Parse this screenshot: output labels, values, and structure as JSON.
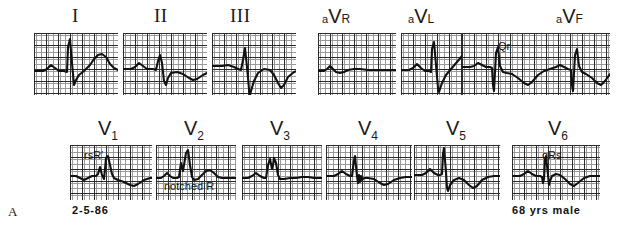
{
  "figure": {
    "letter": "A",
    "date": "2-5-86",
    "patient": "68 yrs male"
  },
  "rows": [
    {
      "name": "limb-leads",
      "panels": [
        {
          "lead": "I",
          "label_kind": "roman",
          "label_text": "I",
          "x": 34,
          "y": 33,
          "w": 84,
          "h": 62,
          "label_x": 72,
          "label_y": 6,
          "annotation": null,
          "trace": "M0,38 L9,38 L13,36 L17,32 L21,35 L25,38 L30,38 L33,39 L34,14 L36,6 L38,30 L40,52 L42,47 L45,42 L50,38 L56,32 L60,26 L64,22 L68,21 L72,24 L76,31 L80,35 L84,37 L92,37 L100,37"
        },
        {
          "lead": "II",
          "label_kind": "roman",
          "label_text": "II",
          "x": 123,
          "y": 33,
          "w": 84,
          "h": 62,
          "label_x": 154,
          "label_y": 6,
          "annotation": null,
          "trace": "M0,36 L8,36 L12,34 L16,30 L20,33 L24,36 L30,36 L33,37 L35,28 L37,22 L39,30 L41,48 L43,52 L45,45 L48,40 L54,39 L60,41 L66,45 L70,47 L74,46 L80,42 L86,39 L92,38 L100,38"
        },
        {
          "lead": "III",
          "label_kind": "roman",
          "label_text": "III",
          "x": 212,
          "y": 33,
          "w": 84,
          "h": 62,
          "label_x": 230,
          "label_y": 6,
          "annotation": null,
          "trace": "M0,33 L10,33 L16,32 L22,34 L26,36 L29,37 L31,27 L33,15 L35,34 L37,56 L38,62 L39,58 L42,48 L46,40 L52,36 L58,37 L62,42 L66,50 L69,55 L72,52 L76,44 L82,39 L88,37 L96,37 L104,37"
        },
        {
          "lead": "aVR",
          "label_kind": "augmented",
          "label_pre": "a",
          "label_main": "V",
          "label_post": "R",
          "x": 318,
          "y": 33,
          "w": 78,
          "h": 62,
          "label_x": 322,
          "label_y": 6,
          "annotation": null,
          "trace": "M0,38 L6,38 L9,36 L12,33 L15,36 L18,39 L22,40 L26,39 L30,37 L36,36 L42,36 L50,37 L58,37 L68,37 L78,37"
        },
        {
          "lead": "aVL",
          "label_kind": "augmented",
          "label_pre": "a",
          "label_main": "V",
          "label_post": "L",
          "x": 401,
          "y": 33,
          "w": 82,
          "h": 62,
          "label_x": 408,
          "label_y": 6,
          "annotation": null,
          "trace": "M0,37 L8,37 L12,35 L16,31 L20,35 L24,38 L28,38 L30,39 L31,16 L33,9 L35,32 L37,55 L38,59 L41,50 L45,42 L50,36 L56,29 L61,23 L66,21 L70,24 L74,31 L78,35 L82,37 L90,37"
        },
        {
          "lead": "aVF",
          "label_kind": "augmented",
          "label_pre": "a",
          "label_main": "V",
          "label_post": "F",
          "x": 462,
          "y": 33,
          "w": 148,
          "h": 62,
          "label_x": 556,
          "label_y": 6,
          "annotation": {
            "text": "Qr",
            "x": 36,
            "y": 8
          },
          "trace": "M0,34 L8,34 L12,33 L16,30 L20,32 L24,34 L28,34 L30,35 L31,52 L32,58 L34,20 L36,14 L38,33 L41,39 L45,40 L50,41 L56,45 L62,50 L66,52 L70,49 L76,42 L82,38 L88,36 L94,34 L98,32 L102,34 L106,36 L109,37 L110,52 L111,58 L113,22 L115,16 L117,33 L120,39 L124,41 L130,45 L135,50 L139,52 L143,48 L148,41 L152,37"
        }
      ]
    },
    {
      "name": "precordial-leads",
      "panels": [
        {
          "lead": "V1",
          "label_kind": "precordial",
          "label_main": "V",
          "label_sub": "1",
          "x": 70,
          "y": 145,
          "w": 82,
          "h": 55,
          "label_x": 98,
          "label_y": 118,
          "annotation": {
            "text": "rsR′",
            "x": 14,
            "y": 5
          },
          "trace": "M0,31 L6,31 L10,33 L14,35 L18,33 L22,31 L26,31 L28,29 L30,22 L32,30 L34,34 L35,24 L36,13 L38,11 L40,20 L42,29 L44,33 L48,35 L54,37 L60,40 L64,41 L68,39 L74,35 L80,33 L86,33 L92,33"
        },
        {
          "lead": "V2",
          "label_kind": "precordial",
          "label_main": "V",
          "label_sub": "2",
          "x": 156,
          "y": 145,
          "w": 80,
          "h": 55,
          "label_x": 184,
          "label_y": 118,
          "annotation": {
            "text": "notched R",
            "x": 8,
            "y": 36
          },
          "trace": "M0,33 L5,33 L8,31 L11,28 L14,31 L17,33 L21,33 L23,32 L25,18 L27,26 L28,20 L30,8 L32,5 L34,20 L36,32 L38,35 L42,34 L46,30 L50,26 L54,25 L58,28 L62,32 L66,33 L72,33 L80,33"
        },
        {
          "lead": "V3",
          "label_kind": "precordial",
          "label_main": "V",
          "label_sub": "3",
          "x": 242,
          "y": 145,
          "w": 80,
          "h": 55,
          "label_x": 270,
          "label_y": 118,
          "annotation": null,
          "trace": "M0,33 L6,33 L10,31 L14,28 L18,31 L22,33 L24,33 L26,20 L28,14 L30,24 L31,20 L32,13 L34,18 L36,30 L38,34 L42,34 L48,33 L54,33 L60,32 L66,32 L72,33 L80,33"
        },
        {
          "lead": "V4",
          "label_kind": "precordial",
          "label_main": "V",
          "label_sub": "4",
          "x": 326,
          "y": 145,
          "w": 86,
          "h": 55,
          "label_x": 358,
          "label_y": 118,
          "annotation": null,
          "trace": "M0,31 L8,31 L12,29 L16,26 L20,29 L24,31 L26,31 L28,15 L29,11 L31,31 L32,38 L33,30 L34,37 L35,31 L36,35 L38,33 L42,33 L48,34 L54,38 L58,40 L62,39 L68,35 L74,33 L80,32 L86,32 L94,32"
        },
        {
          "lead": "V5",
          "label_kind": "precordial",
          "label_main": "V",
          "label_sub": "5",
          "x": 414,
          "y": 145,
          "w": 86,
          "h": 55,
          "label_x": 446,
          "label_y": 118,
          "annotation": null,
          "trace": "M0,30 L8,30 L12,28 L16,24 L20,28 L24,30 L26,30 L28,29 L29,9 L30,3 L32,27 L33,43 L34,46 L36,40 L40,35 L45,33 L50,35 L55,40 L59,43 L63,41 L68,35 L74,32 L80,31 L86,31 L92,31"
        },
        {
          "lead": "V6",
          "label_kind": "precordial",
          "label_main": "V",
          "label_sub": "6",
          "x": 512,
          "y": 145,
          "w": 88,
          "h": 55,
          "label_x": 548,
          "label_y": 118,
          "annotation": {
            "text": "qRs",
            "x": 30,
            "y": 5
          },
          "trace": "M0,31 L8,31 L12,29 L16,26 L20,29 L24,31 L28,31 L30,32 L31,38 L32,34 L33,14 L34,11 L36,30 L37,40 L38,36 L40,31 L44,29 L48,30 L53,34 L58,39 L62,41 L66,38 L72,33 L78,31 L86,31 L96,31"
        }
      ]
    }
  ]
}
